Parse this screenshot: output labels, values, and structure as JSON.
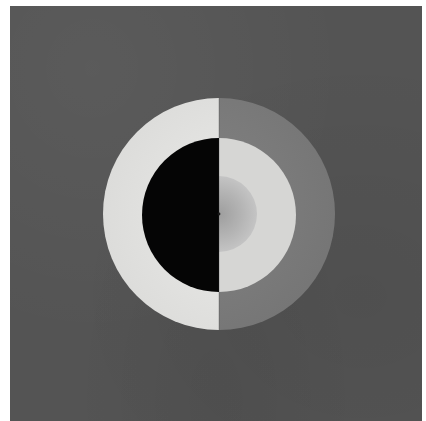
{
  "artwork": {
    "type": "abstract-painting",
    "description": "Concentric circles split vertically into two halves on a dark grey ground",
    "colors": {
      "ground": "#545454",
      "left_outer_ring": "#e4e4e2",
      "left_inner_disc": "#050505",
      "right_outer_ring": "#7c7c7c",
      "right_inner_ring": "#d6d6d4",
      "center_disc_edge": "#c2c2c2",
      "center_disc_core": "#a8a8a8",
      "center_dot": "#1a1a1a"
    },
    "geometry": {
      "center": [
        219,
        214
      ],
      "outer_radius": 116,
      "inner_radius": 77,
      "core_radius": 38
    }
  }
}
